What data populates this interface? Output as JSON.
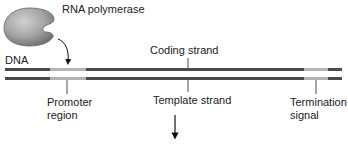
{
  "diagram": {
    "enzyme": {
      "label": "RNA polymerase",
      "icon": "rna-polymerase-blob"
    },
    "dna": {
      "label": "DNA"
    },
    "strands": {
      "coding": {
        "label": "Coding strand"
      },
      "template": {
        "label": "Template strand"
      }
    },
    "regions": {
      "promoter": {
        "line1": "Promoter",
        "line2": "region"
      },
      "termination": {
        "line1": "Termination",
        "line2": "signal"
      }
    },
    "arrows": {
      "binding": "curved-arrow-polymerase-to-promoter",
      "transcription": "down-arrow"
    },
    "colors": {
      "strand": "#4b4b4b",
      "region": "#b4b4b4",
      "enzyme_fill": "#9a9a9a",
      "enzyme_highlight": "#c9c9c9",
      "text": "#222222"
    }
  }
}
